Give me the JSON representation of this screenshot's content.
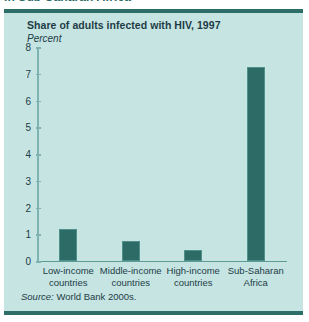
{
  "page": {
    "cut_heading": "in Sub-Saharan Africa"
  },
  "figure": {
    "title": "Share of adults infected with HIV, 1997",
    "subtitle": "Percent",
    "source_prefix": "Source:",
    "source_text": " World Bank 2000s."
  },
  "colors": {
    "panel_background": "#c6e4e2",
    "rule": "#2e6e69",
    "bar": "#2c6b66",
    "axis": "#7fb3b0",
    "text": "#1d3c46"
  },
  "chart_data": {
    "type": "bar",
    "title": "Share of adults infected with HIV, 1997",
    "subtitle": "Percent",
    "xlabel": "",
    "ylabel": "Percent",
    "ylim": [
      0,
      8
    ],
    "yticks": [
      0,
      1,
      2,
      3,
      4,
      5,
      6,
      7,
      8
    ],
    "ytick_labels": [
      "0",
      "1",
      "2",
      "3",
      "4",
      "5",
      "6",
      "7",
      "8"
    ],
    "grid": false,
    "legend": null,
    "categories": [
      "Low-income countries",
      "Middle-income countries",
      "High-income countries",
      "Sub-Saharan Africa"
    ],
    "category_lines": [
      [
        "Low-income",
        "countries"
      ],
      [
        "Middle-income",
        "countries"
      ],
      [
        "High-income",
        "countries"
      ],
      [
        "Sub-Saharan",
        "Africa"
      ]
    ],
    "values": [
      1.2,
      0.75,
      0.4,
      7.25
    ],
    "source": "Source: World Bank 2000s."
  }
}
